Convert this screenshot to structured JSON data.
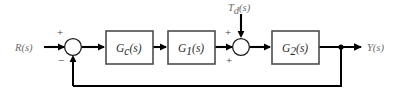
{
  "diagram": {
    "type": "control-system-block-diagram",
    "canvas": {
      "width": 393,
      "height": 102
    },
    "colors": {
      "background": "#ffffff",
      "wire": "#000000",
      "block_border": "#4d4d4d",
      "block_fill": "#ffffff",
      "block_text": "#2b2b2b",
      "signal_text": "#6b6b6b",
      "sign_text": "#3a3a3a"
    },
    "signals": {
      "reference": {
        "base": "R",
        "arg": "(s)",
        "full": "R(s)"
      },
      "disturbance": {
        "base": "T",
        "sub": "d",
        "arg": "(s)",
        "full": "Td(s)"
      },
      "output": {
        "base": "Y",
        "arg": "(s)",
        "full": "Y(s)"
      }
    },
    "blocks": [
      {
        "id": "controller",
        "base": "G",
        "sub": "c",
        "arg": "(s)",
        "full": "Gc(s)"
      },
      {
        "id": "plant-1",
        "base": "G",
        "sub": "1",
        "arg": "(s)",
        "full": "G1(s)"
      },
      {
        "id": "plant-2",
        "base": "G",
        "sub": "2",
        "arg": "(s)",
        "full": "G2(s)"
      }
    ],
    "summing_junctions": [
      {
        "id": "error-junction",
        "signs": {
          "reference_input": "+",
          "feedback_input": "−"
        }
      },
      {
        "id": "disturbance-junction",
        "signs": {
          "forward_input": "+",
          "disturbance_input": "+"
        }
      }
    ],
    "feedback": {
      "label": "unity-feedback",
      "sign": "−"
    }
  }
}
